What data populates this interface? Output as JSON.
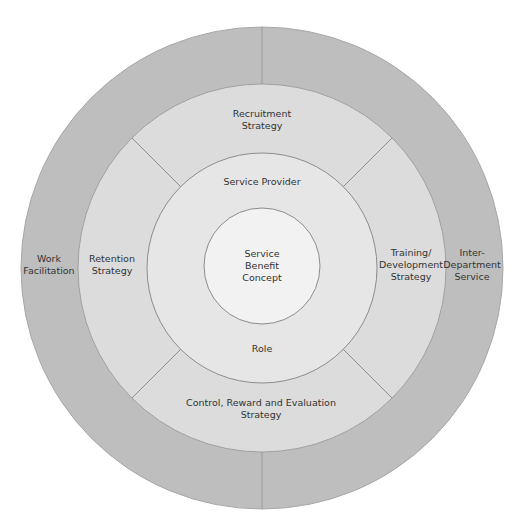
{
  "diagram": {
    "center": {
      "x": 262,
      "y": 268
    },
    "colors": {
      "outer_ring": "#bebebe",
      "strategy_ring": "#dcdcdc",
      "role_ring": "#e6e6e6",
      "core": "#f2f2f2",
      "stroke": "#8c8c8c",
      "text": "#333333"
    },
    "rings": [
      {
        "name": "outer-ring",
        "radius": 241
      },
      {
        "name": "strategy-ring",
        "radius": 184
      },
      {
        "name": "role-ring",
        "radius": 115
      },
      {
        "name": "core",
        "radius": 58
      }
    ],
    "labels": {
      "core": "Service\nBenefit\nConcept",
      "role_top": "Service Provider",
      "role_bottom": "Role",
      "strategy_top": "Recruitment\nStrategy",
      "strategy_left": "Retention\nStrategy",
      "strategy_right": "Training/\nDevelopment\nStrategy",
      "strategy_bottom": "Control, Reward and Evaluation\nStrategy",
      "outer_left": "Work\nFacilitation",
      "outer_right": "Inter-\nDepartment\nService"
    }
  }
}
